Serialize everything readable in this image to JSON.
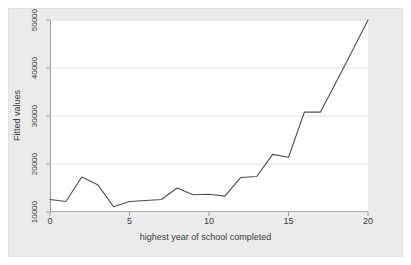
{
  "chart_data": {
    "type": "line",
    "title": "",
    "subtitle": "",
    "xlabel": "highest year of school completed",
    "ylabel": "Fitted values",
    "xlim": [
      0,
      20
    ],
    "ylim": [
      10000,
      50000
    ],
    "xticks": [
      0,
      5,
      10,
      15,
      20
    ],
    "xtick_labels": [
      "0",
      "5",
      "10",
      "15",
      "20"
    ],
    "yticks": [
      10000,
      20000,
      30000,
      40000,
      50000
    ],
    "ytick_labels": [
      "10000",
      "20000",
      "30000",
      "40000",
      "50000"
    ],
    "grid": "horizontal",
    "legend": "none",
    "line_color": "#4d4d4d",
    "background_color": "#ebebeb",
    "plot_background_color": "#ffffff",
    "axis_color": "#9a9a9a",
    "gridline_color": "#d9d9d9",
    "series": [
      {
        "name": "Fitted values",
        "x": [
          0,
          1,
          2,
          3,
          4,
          5,
          6,
          7,
          8,
          9,
          10,
          11,
          12,
          13,
          14,
          15,
          16,
          17,
          18,
          19,
          20
        ],
        "values": [
          12600,
          12200,
          17300,
          15700,
          11100,
          12200,
          12400,
          12600,
          15000,
          13600,
          13700,
          13300,
          17200,
          17400,
          22000,
          21400,
          30800,
          30800,
          37100,
          43500,
          50000
        ]
      }
    ]
  }
}
